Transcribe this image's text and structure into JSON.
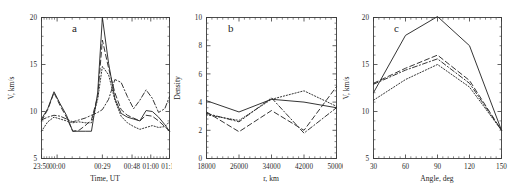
{
  "figure": {
    "background_color": "#ffffff",
    "line_color": "#2a2a2a",
    "panel_letters": [
      "a",
      "b",
      "c"
    ]
  },
  "chart_data": [
    {
      "type": "line",
      "panel": "a",
      "panel_label": "a",
      "title": "",
      "xlabel": "Time, UT",
      "ylabel": "V, km/s",
      "xtick_labels": [
        "23:50",
        "00:00",
        "00:29",
        "00:48",
        "01:00",
        "01:12"
      ],
      "xtick_values": [
        0,
        10,
        39,
        58,
        70,
        82
      ],
      "ytick_labels": [
        "5",
        "10",
        "15",
        "20"
      ],
      "ytick_values": [
        5,
        10,
        15,
        20
      ],
      "xlim": [
        0,
        82
      ],
      "ylim": [
        5,
        20
      ],
      "grid": false,
      "legend_position": "none",
      "x": [
        0,
        4,
        8,
        12,
        16,
        20,
        24,
        28,
        32,
        36,
        39,
        43,
        47,
        51,
        55,
        59,
        63,
        67,
        71,
        75,
        79,
        82
      ],
      "series": [
        {
          "name": "curve-1",
          "style": "solid",
          "values": [
            9.2,
            10.3,
            12.1,
            10.8,
            9.6,
            7.9,
            7.9,
            7.9,
            7.9,
            12.0,
            20.0,
            15.1,
            11.4,
            9.8,
            9.4,
            9.2,
            9.0,
            10.1,
            10.0,
            9.4,
            8.6,
            7.9
          ]
        },
        {
          "name": "curve-2",
          "style": "dashed",
          "values": [
            9.0,
            10.2,
            12.0,
            10.6,
            9.4,
            7.9,
            8.0,
            8.5,
            9.1,
            11.6,
            17.6,
            14.6,
            12.0,
            10.2,
            9.6,
            9.3,
            9.0,
            9.6,
            9.5,
            9.0,
            8.4,
            7.9
          ]
        },
        {
          "name": "curve-3",
          "style": "dotted",
          "values": [
            7.9,
            8.9,
            9.4,
            9.2,
            9.0,
            8.8,
            8.9,
            8.8,
            8.8,
            11.3,
            14.8,
            13.9,
            11.2,
            9.5,
            8.8,
            8.4,
            8.1,
            8.3,
            8.5,
            8.3,
            8.4,
            8.9
          ]
        },
        {
          "name": "curve-4",
          "style": "dashdot",
          "values": [
            9.1,
            9.4,
            9.6,
            9.5,
            9.2,
            8.9,
            9.1,
            9.3,
            9.6,
            9.9,
            10.2,
            11.3,
            13.4,
            13.1,
            11.6,
            10.3,
            11.2,
            12.3,
            11.4,
            9.9,
            10.3,
            11.6
          ]
        }
      ]
    },
    {
      "type": "line",
      "panel": "b",
      "panel_label": "b",
      "title": "",
      "xlabel": "r, km",
      "ylabel": "Density",
      "xtick_labels": [
        "18000",
        "26000",
        "34000",
        "42000",
        "50000"
      ],
      "xtick_values": [
        18000,
        26000,
        34000,
        42000,
        50000
      ],
      "ytick_labels": [
        "0",
        "2",
        "4",
        "6",
        "8",
        "10"
      ],
      "ytick_values": [
        0,
        2,
        4,
        6,
        8,
        10
      ],
      "xlim": [
        18000,
        50000
      ],
      "ylim": [
        0,
        10
      ],
      "grid": false,
      "legend_position": "none",
      "x": [
        18000,
        26000,
        34000,
        42000,
        50000
      ],
      "series": [
        {
          "name": "curve-1",
          "style": "solid",
          "values": [
            4.1,
            3.3,
            4.2,
            4.0,
            3.6
          ]
        },
        {
          "name": "curve-2",
          "style": "dashed",
          "values": [
            3.3,
            1.9,
            3.4,
            2.0,
            5.1
          ]
        },
        {
          "name": "curve-3",
          "style": "dotted",
          "values": [
            3.1,
            2.7,
            4.2,
            4.8,
            3.7
          ]
        },
        {
          "name": "curve-4",
          "style": "dashdot",
          "values": [
            3.2,
            2.6,
            4.3,
            1.8,
            3.6
          ]
        }
      ]
    },
    {
      "type": "line",
      "panel": "c",
      "panel_label": "c",
      "title": "",
      "xlabel": "Angle, deg",
      "ylabel": "V, km/s",
      "xtick_labels": [
        "30",
        "60",
        "90",
        "120",
        "150"
      ],
      "xtick_values": [
        30,
        60,
        90,
        120,
        150
      ],
      "ytick_labels": [
        "5",
        "10",
        "15",
        "20"
      ],
      "ytick_values": [
        5,
        10,
        15,
        20
      ],
      "xlim": [
        30,
        150
      ],
      "ylim": [
        5,
        20
      ],
      "grid": false,
      "legend_position": "none",
      "x": [
        30,
        60,
        90,
        120,
        150
      ],
      "series": [
        {
          "name": "curve-1",
          "style": "solid",
          "values": [
            12.0,
            18.1,
            20.1,
            17.0,
            8.0
          ]
        },
        {
          "name": "curve-2",
          "style": "dashed",
          "values": [
            13.0,
            14.6,
            16.0,
            13.3,
            8.0
          ]
        },
        {
          "name": "curve-3",
          "style": "dotted",
          "values": [
            11.2,
            13.4,
            15.0,
            12.6,
            8.0
          ]
        },
        {
          "name": "curve-4",
          "style": "dashdot",
          "values": [
            12.9,
            14.4,
            15.6,
            13.0,
            8.0
          ]
        }
      ]
    }
  ]
}
